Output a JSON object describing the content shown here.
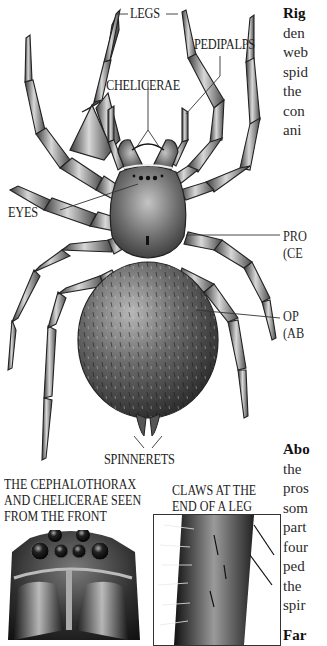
{
  "figure": {
    "labels": {
      "legs": "LEGS",
      "pedipalps": "PEDIPALPS",
      "chelicerae": "CHELICERAE",
      "eyes": "EYES",
      "prosoma": "PRO",
      "prosoma_sub": "(CE",
      "opisthosoma": "OP",
      "opisthosoma_sub": "(AB",
      "spinnerets": "SPINNERETS"
    },
    "insets": [
      {
        "caption_lines": [
          "THE CEPHALOTHORAX",
          "AND CHELICERAE SEEN",
          "FROM THE FRONT"
        ],
        "subject": "cephalothorax front view"
      },
      {
        "caption_lines": [
          "CLAWS AT THE",
          "END OF A LEG"
        ],
        "subject": "leg claw close-up"
      }
    ]
  },
  "sidebar_text": {
    "top_paragraph": {
      "heading": "Rig",
      "lines": [
        "den",
        "web",
        "spid",
        "the",
        "con",
        "ani"
      ]
    },
    "bottom_paragraph": {
      "heading": "Abo",
      "lines": [
        "the",
        "pros",
        "som",
        "part",
        "four",
        "ped",
        "the",
        "spir"
      ]
    },
    "next_heading": "Far"
  },
  "colors": {
    "background": "#ffffff",
    "ink": "#222222",
    "body_dark": "#3a3a3a",
    "body_mid": "#7a7a7a",
    "body_light": "#d0d0d0"
  }
}
